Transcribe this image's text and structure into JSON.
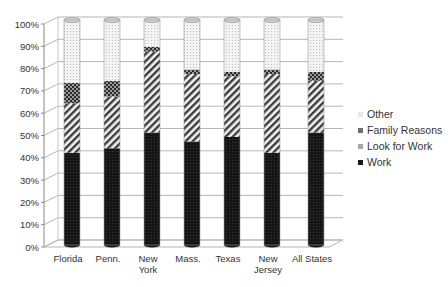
{
  "chart_data": {
    "type": "bar",
    "subtype": "stacked-100-percent-3d-cylinder",
    "title": "",
    "xlabel": "",
    "ylabel": "",
    "ylim": [
      0,
      100
    ],
    "yticks": [
      "0%",
      "10%",
      "20%",
      "30%",
      "40%",
      "50%",
      "60%",
      "70%",
      "80%",
      "90%",
      "100%"
    ],
    "grid": true,
    "legend_position": "right",
    "categories": [
      "Florida",
      "Penn.",
      "New York",
      "Mass.",
      "Texas",
      "New Jersey",
      "All States"
    ],
    "category_labels": [
      [
        "Florida"
      ],
      [
        "Penn."
      ],
      [
        "New",
        "York"
      ],
      [
        "Mass."
      ],
      [
        "Texas"
      ],
      [
        "New",
        "Jersey"
      ],
      [
        "All States"
      ]
    ],
    "series": [
      {
        "name": "Work",
        "pattern": "dark-dots",
        "color": "#1a1a1a",
        "values": [
          41,
          43,
          50,
          46,
          48,
          41,
          50
        ]
      },
      {
        "name": "Look for Work",
        "pattern": "diagonal-stripes",
        "color": "#8c8c8c",
        "values": [
          22,
          23,
          36,
          30,
          27,
          35,
          23
        ]
      },
      {
        "name": "Family Reasons",
        "pattern": "checker",
        "color": "#555555",
        "values": [
          9,
          7,
          2,
          2,
          2,
          2,
          4
        ]
      },
      {
        "name": "Other",
        "pattern": "light-dots",
        "color": "#e8e8e8",
        "values": [
          28,
          27,
          12,
          22,
          23,
          22,
          23
        ]
      }
    ],
    "legend": [
      "Other",
      "Family Reasons",
      "Look for Work",
      "Work"
    ]
  }
}
